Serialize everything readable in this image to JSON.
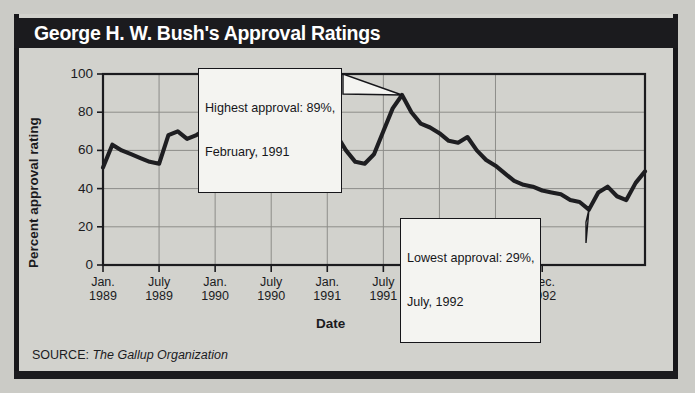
{
  "header": {
    "title": "George H. W. Bush's Approval Ratings"
  },
  "source": {
    "prefix": "SOURCE:",
    "name": "The Gallup Organization"
  },
  "annotations": {
    "highest": {
      "line1": "Highest approval: 89%,",
      "line2": "February, 1991",
      "value": 89,
      "date": "February, 1991"
    },
    "lowest": {
      "line1": "Lowest approval: 29%,",
      "line2": "July, 1992",
      "value": 29,
      "date": "July, 1992"
    }
  },
  "axis": {
    "y_title": "Percent approval rating",
    "x_title": "Date",
    "y_ticks": [
      "100",
      "80",
      "60",
      "40",
      "20",
      "0"
    ],
    "x_ticks": [
      {
        "l1": "Jan.",
        "l2": "1989"
      },
      {
        "l1": "July",
        "l2": "1989"
      },
      {
        "l1": "Jan.",
        "l2": "1990"
      },
      {
        "l1": "July",
        "l2": "1990"
      },
      {
        "l1": "Jan.",
        "l2": "1991"
      },
      {
        "l1": "July",
        "l2": "1991"
      },
      {
        "l1": "Jan.",
        "l2": "1992"
      },
      {
        "l1": "July",
        "l2": "1992"
      },
      {
        "l1": "Dec.",
        "l2": "1992"
      }
    ]
  },
  "colors": {
    "title_bar": "#1b1b1e",
    "panel": "#d2d2cd",
    "line": "#1e1e21",
    "grid": "#8d8d89",
    "callout_bg": "#f4f4f1"
  },
  "chart_data": {
    "type": "line",
    "title": "George H. W. Bush's Approval Ratings",
    "xlabel": "Date",
    "ylabel": "Percent approval rating",
    "ylim": [
      0,
      100
    ],
    "ytick_values": [
      0,
      20,
      40,
      60,
      80,
      100
    ],
    "grid": true,
    "legend": "none",
    "source": "The Gallup Organization",
    "x_tick_labels": [
      "Jan. 1989",
      "July 1989",
      "Jan. 1990",
      "July 1990",
      "Jan. 1991",
      "July 1991",
      "Jan. 1992",
      "July 1992",
      "Dec. 1992"
    ],
    "x_tick_positions": [
      0,
      6,
      12,
      18,
      24,
      30,
      36,
      42,
      47
    ],
    "x_unit": "months since January 1989",
    "series": [
      {
        "name": "Percent approval rating",
        "points": [
          {
            "x": 0,
            "label": "Jan. 1989",
            "y": 51
          },
          {
            "x": 1,
            "label": "Feb. 1989",
            "y": 63
          },
          {
            "x": 2,
            "label": "Mar. 1989",
            "y": 60
          },
          {
            "x": 3,
            "label": "Apr. 1989",
            "y": 58
          },
          {
            "x": 4,
            "label": "May 1989",
            "y": 56
          },
          {
            "x": 5,
            "label": "June 1989",
            "y": 54
          },
          {
            "x": 6,
            "label": "July 1989",
            "y": 53
          },
          {
            "x": 7,
            "label": "Aug. 1989",
            "y": 68
          },
          {
            "x": 8,
            "label": "Sept. 1989",
            "y": 70
          },
          {
            "x": 9,
            "label": "Oct. 1989",
            "y": 66
          },
          {
            "x": 10,
            "label": "Nov. 1989",
            "y": 68
          },
          {
            "x": 11,
            "label": "Dec. 1989",
            "y": 71
          },
          {
            "x": 12,
            "label": "Jan. 1990",
            "y": 70
          },
          {
            "x": 13,
            "label": "Feb. 1990",
            "y": 73
          },
          {
            "x": 14,
            "label": "Mar. 1990",
            "y": 74
          },
          {
            "x": 15,
            "label": "Apr. 1990",
            "y": 72
          },
          {
            "x": 16,
            "label": "May 1990",
            "y": 80
          },
          {
            "x": 17,
            "label": "June 1990",
            "y": 74
          },
          {
            "x": 18,
            "label": "July 1990",
            "y": 72
          },
          {
            "x": 19,
            "label": "Aug. 1990",
            "y": 74
          },
          {
            "x": 20,
            "label": "Sept. 1990",
            "y": 68
          },
          {
            "x": 21,
            "label": "Oct. 1990",
            "y": 66
          },
          {
            "x": 22,
            "label": "Nov. 1990",
            "y": 67
          },
          {
            "x": 23,
            "label": "Dec. 1990",
            "y": 58
          },
          {
            "x": 24,
            "label": "Jan. 1991",
            "y": 76
          },
          {
            "x": 25,
            "label": "Feb. 1991",
            "y": 68
          },
          {
            "x": 26,
            "label": "Mar. 1991",
            "y": 60
          },
          {
            "x": 27,
            "label": "Apr. 1991",
            "y": 54
          },
          {
            "x": 28,
            "label": "May 1991",
            "y": 53
          },
          {
            "x": 29,
            "label": "June 1991",
            "y": 58
          },
          {
            "x": 30,
            "label": "July 1991",
            "y": 70
          },
          {
            "x": 31,
            "label": "Aug. 1991",
            "y": 82
          },
          {
            "x": 32,
            "label": "Sept. 1991",
            "y": 89
          },
          {
            "x": 33,
            "label": "Oct. 1991",
            "y": 80
          },
          {
            "x": 34,
            "label": "Nov. 1991",
            "y": 74
          },
          {
            "x": 35,
            "label": "Dec. 1991",
            "y": 72
          },
          {
            "x": 36,
            "label": "Jan. 1992",
            "y": 69
          },
          {
            "x": 37,
            "label": "Feb. 1992",
            "y": 65
          },
          {
            "x": 38,
            "label": "Mar. 1992",
            "y": 64
          },
          {
            "x": 39,
            "label": "Apr. 1992",
            "y": 67
          },
          {
            "x": 40,
            "label": "May 1992",
            "y": 60
          },
          {
            "x": 41,
            "label": "June 1992",
            "y": 55
          },
          {
            "x": 42,
            "label": "July 1992",
            "y": 52
          },
          {
            "x": 43,
            "label": "Aug. 1992",
            "y": 48
          },
          {
            "x": 44,
            "label": "Sept. 1992",
            "y": 44
          },
          {
            "x": 45,
            "label": "Oct. 1992",
            "y": 42
          },
          {
            "x": 46,
            "label": "Nov. 1992",
            "y": 41
          },
          {
            "x": 47,
            "label": "Dec. 1992",
            "y": 39
          },
          {
            "x": 48,
            "label": "Jan. 1993",
            "y": 38
          },
          {
            "x": 49,
            "label": "Feb. 1993",
            "y": 37
          },
          {
            "x": 50,
            "label": "Mar. 1993",
            "y": 34
          },
          {
            "x": 51,
            "label": "Apr. 1993",
            "y": 33
          },
          {
            "x": 52,
            "label": "May 1993",
            "y": 29
          },
          {
            "x": 53,
            "label": "June 1993",
            "y": 38
          },
          {
            "x": 54,
            "label": "July 1993",
            "y": 41
          },
          {
            "x": 55,
            "label": "Aug. 1993",
            "y": 36
          },
          {
            "x": 56,
            "label": "Sept. 1993",
            "y": 34
          },
          {
            "x": 57,
            "label": "Oct. 1993",
            "y": 43
          },
          {
            "x": 58,
            "label": "Nov. 1993",
            "y": 49
          }
        ]
      }
    ],
    "annotations": [
      {
        "text": "Highest approval: 89%, February, 1991",
        "target_x": 32,
        "target_y": 89
      },
      {
        "text": "Lowest approval: 29%, July, 1992",
        "target_x": 52,
        "target_y": 29
      }
    ]
  }
}
